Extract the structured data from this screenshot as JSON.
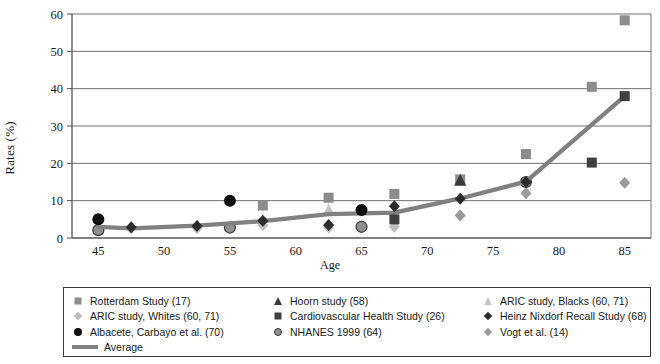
{
  "chart_data": {
    "type": "scatter",
    "title": "",
    "xlabel": "Age",
    "ylabel": "Rates (%)",
    "xlim": [
      43,
      87
    ],
    "ylim": [
      0,
      60
    ],
    "xticks": [
      45,
      50,
      55,
      60,
      65,
      70,
      75,
      80,
      85
    ],
    "yticks": [
      0,
      10,
      20,
      30,
      40,
      50,
      60
    ],
    "grid": "horizontal",
    "legend_position": "below",
    "series": [
      {
        "name": "Rotterdam Study (17)",
        "marker": "square",
        "color": "#8c8c8c",
        "points": [
          [
            57.5,
            8.7
          ],
          [
            62.5,
            10.8
          ],
          [
            67.5,
            11.8
          ],
          [
            72.5,
            15.7
          ],
          [
            77.5,
            22.5
          ],
          [
            82.5,
            40.5
          ],
          [
            85,
            58.3
          ]
        ]
      },
      {
        "name": "Hoorn study (58)",
        "marker": "triangle",
        "color": "#3a3a3a",
        "points": [
          [
            72.5,
            15.5
          ]
        ]
      },
      {
        "name": "ARIC study, Blacks (60, 71)",
        "marker": "triangle",
        "color": "#c6c6c6",
        "points": [
          [
            62.5,
            7.5
          ]
        ]
      },
      {
        "name": "ARIC study, Whites (60, 71)",
        "marker": "diamond",
        "color": "#bdbdbd",
        "points": [
          [
            47.5,
            2.5
          ],
          [
            52.5,
            2.6
          ],
          [
            57.5,
            3.4
          ],
          [
            62.5,
            2.8
          ],
          [
            67.5,
            3.0
          ]
        ]
      },
      {
        "name": "Cardiovascular Health Study (26)",
        "marker": "square",
        "color": "#3f3f3f",
        "points": [
          [
            67.5,
            5.0
          ],
          [
            82.5,
            20.2
          ],
          [
            85,
            38.0
          ]
        ]
      },
      {
        "name": "Heinz Nixdorf Recall Study (68)",
        "marker": "diamond",
        "color": "#2b2b2b",
        "points": [
          [
            47.5,
            2.9
          ],
          [
            52.5,
            3.2
          ],
          [
            57.5,
            4.6
          ],
          [
            62.5,
            3.5
          ],
          [
            67.5,
            8.5
          ],
          [
            72.5,
            10.5
          ],
          [
            77.5,
            15.0
          ]
        ]
      },
      {
        "name": "Albacete, Carbayo et al. (70)",
        "marker": "circle",
        "color": "#0d0d0d",
        "points": [
          [
            45,
            5.0
          ],
          [
            55,
            10.0
          ],
          [
            65,
            7.5
          ]
        ]
      },
      {
        "name": "NHANES 1999 (64)",
        "marker": "circle-outline",
        "color": "#8f8f8f",
        "points": [
          [
            45,
            2.1
          ],
          [
            55,
            2.8
          ],
          [
            65,
            3.0
          ],
          [
            77.5,
            15.0
          ]
        ]
      },
      {
        "name": "Vogt et al. (14)",
        "marker": "diamond",
        "color": "#9a9a9a",
        "points": [
          [
            72.5,
            6.0
          ],
          [
            77.5,
            12.0
          ],
          [
            85,
            14.8
          ]
        ]
      },
      {
        "name": "Average",
        "marker": "line",
        "color": "#808080",
        "points": [
          [
            45,
            3.0
          ],
          [
            47.5,
            2.6
          ],
          [
            52.5,
            3.3
          ],
          [
            57.5,
            4.5
          ],
          [
            62.5,
            6.4
          ],
          [
            67.5,
            6.8
          ],
          [
            72.5,
            10.6
          ],
          [
            77.5,
            15.1
          ],
          [
            85,
            38.0
          ]
        ]
      }
    ],
    "legend": [
      {
        "label": "Rotterdam Study (17)",
        "marker": "square",
        "color": "#8c8c8c",
        "col": 1,
        "row": 1
      },
      {
        "label": "Hoorn study (58)",
        "marker": "triangle",
        "color": "#3a3a3a",
        "col": 2,
        "row": 1
      },
      {
        "label": "ARIC study, Blacks (60, 71)",
        "marker": "triangle",
        "color": "#c6c6c6",
        "col": 3,
        "row": 1
      },
      {
        "label": "ARIC study, Whites (60, 71)",
        "marker": "diamond",
        "color": "#bdbdbd",
        "col": 1,
        "row": 2
      },
      {
        "label": "Cardiovascular Health Study (26)",
        "marker": "square",
        "color": "#3f3f3f",
        "col": 2,
        "row": 2
      },
      {
        "label": "Heinz Nixdorf Recall Study (68)",
        "marker": "diamond",
        "color": "#2b2b2b",
        "col": 3,
        "row": 2
      },
      {
        "label": "Albacete, Carbayo et al. (70)",
        "marker": "circle",
        "color": "#0d0d0d",
        "col": 1,
        "row": 3
      },
      {
        "label": "NHANES 1999 (64)",
        "marker": "circle-outline",
        "color": "#8f8f8f",
        "col": 2,
        "row": 3
      },
      {
        "label": "Vogt et al. (14)",
        "marker": "diamond",
        "color": "#9a9a9a",
        "col": 3,
        "row": 3
      },
      {
        "label": "Average",
        "marker": "line",
        "color": "#808080",
        "col": 1,
        "row": 4
      }
    ]
  },
  "axis": {
    "x_title": "Age",
    "y_title": "Rates (%)",
    "x_tick_labels": [
      "45",
      "50",
      "55",
      "60",
      "65",
      "70",
      "75",
      "80",
      "85"
    ],
    "y_tick_labels": [
      "0",
      "10",
      "20",
      "30",
      "40",
      "50",
      "60"
    ]
  },
  "colors": {
    "grid": "#6f6f6f",
    "frame": "#4a4a4a",
    "average_line": "#808080",
    "background": "#ffffff"
  }
}
